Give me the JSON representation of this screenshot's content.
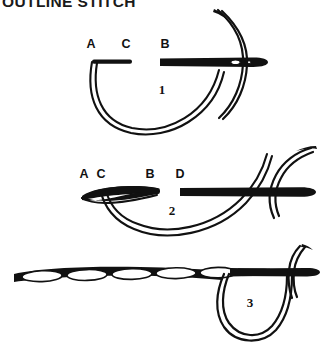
{
  "page": {
    "title": "OUTLINE STITCH",
    "background_color": "#ffffff",
    "ink_color": "#111111",
    "width": 324,
    "height": 360
  },
  "diagrams": [
    {
      "number": "1",
      "number_pos": {
        "x": 162,
        "y": 94
      },
      "caption_points": [
        {
          "label": "A",
          "x": 91,
          "y": 48
        },
        {
          "label": "C",
          "x": 126,
          "y": 48
        },
        {
          "label": "B",
          "x": 165,
          "y": 48
        }
      ]
    },
    {
      "number": "2",
      "number_pos": {
        "x": 172,
        "y": 215
      },
      "caption_points": [
        {
          "label": "A",
          "x": 84,
          "y": 178
        },
        {
          "label": "C",
          "x": 101,
          "y": 178
        },
        {
          "label": "B",
          "x": 150,
          "y": 178
        },
        {
          "label": "D",
          "x": 180,
          "y": 178
        }
      ]
    },
    {
      "number": "3",
      "number_pos": {
        "x": 250,
        "y": 307
      },
      "caption_points": []
    }
  ],
  "icons": {
    "needle": "sewing-needle-icon",
    "thread": "thread-loop-icon",
    "stitch_row": "braided-stitch-row-icon"
  }
}
